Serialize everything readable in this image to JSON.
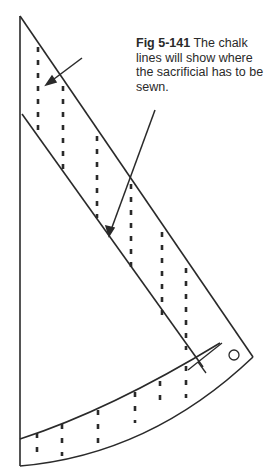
{
  "figure": {
    "label": "Fig 5-141",
    "caption_text": " The chalk lines will show where the sacrificial has to be sewn.",
    "line_color": "#2a2a2a",
    "background": "#ffffff"
  },
  "diagram_elements": {
    "sail_outline": "triangular sail panel",
    "chalk_lines": "dashed vertical lines",
    "arrows": 2,
    "grommet": "circle near clew"
  }
}
